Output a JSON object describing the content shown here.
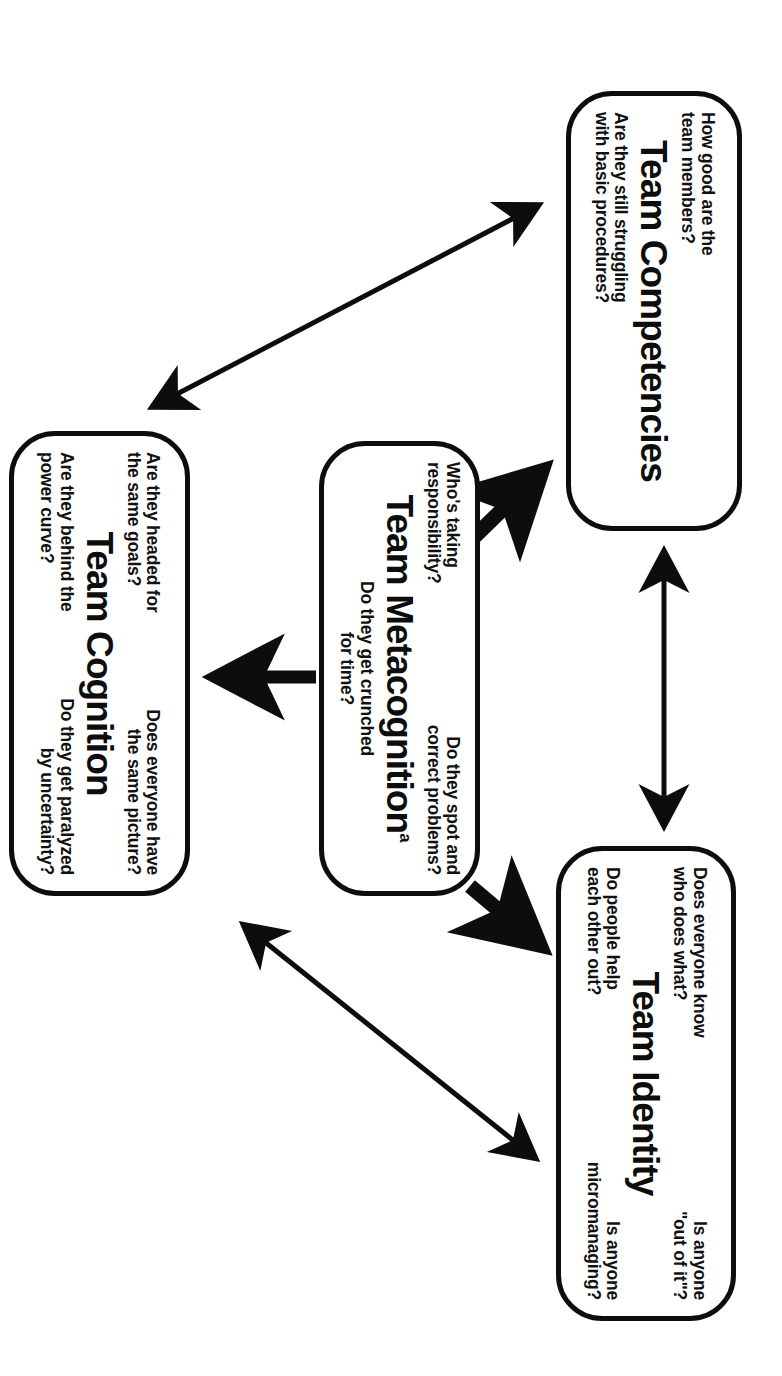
{
  "diagram": {
    "type": "concept-diagram",
    "orientation_note": "rotated-90-clockwise-scan",
    "boxes": [
      {
        "id": "team-identity",
        "title": "Team Identity",
        "title_superscript": "",
        "questions_top_left": "Does everyone know\nwho does what?",
        "questions_top_right": "Is anyone\n\"out of it\"?",
        "questions_bottom_left": "Do people help\neach other out?",
        "questions_bottom_right": "Is anyone\nmicromanaging?"
      },
      {
        "id": "team-competencies",
        "title": "Team Competencies",
        "title_superscript": "",
        "questions_top_left": "How good are the\nteam members?",
        "questions_top_right": "",
        "questions_bottom_left": "Are they still struggling\nwith basic procedures?",
        "questions_bottom_right": ""
      },
      {
        "id": "team-metacognition",
        "title": "Team Metacognition",
        "title_superscript": "a",
        "questions_top_left": "Who's taking\nresponsibility?",
        "questions_top_right": "Do they spot and\ncorrect problems?",
        "questions_bottom_left": "",
        "questions_bottom_right": "",
        "questions_bottom_center": "Do they get crunched\nfor time?"
      },
      {
        "id": "team-cognition",
        "title": "Team Cognition",
        "title_superscript": "",
        "questions_top_left": "Are they headed for\nthe same goals?",
        "questions_top_right": "Does everyone have\nthe same picture?",
        "questions_bottom_left": "Are they behind the\npower curve?",
        "questions_bottom_right": "Do they get paralyzed\nby uncertainty?"
      }
    ],
    "connectors": [
      {
        "id": "competencies-identity",
        "from": "team-competencies",
        "to": "team-identity",
        "style": "thin",
        "heads": "both"
      },
      {
        "id": "identity-cognition",
        "from": "team-identity",
        "to": "team-cognition",
        "style": "thin",
        "heads": "both"
      },
      {
        "id": "competencies-cognition",
        "from": "team-competencies",
        "to": "team-cognition",
        "style": "thin",
        "heads": "both"
      },
      {
        "id": "metacognition-identity",
        "from": "team-metacognition",
        "to": "team-identity",
        "style": "thick",
        "heads": "single"
      },
      {
        "id": "metacognition-competencies",
        "from": "team-metacognition",
        "to": "team-competencies",
        "style": "thick",
        "heads": "single"
      },
      {
        "id": "metacognition-cognition",
        "from": "team-metacognition",
        "to": "team-cognition",
        "style": "thick",
        "heads": "single"
      }
    ],
    "colors": {
      "ink": "#0d0d0d",
      "background": "#ffffff"
    }
  }
}
